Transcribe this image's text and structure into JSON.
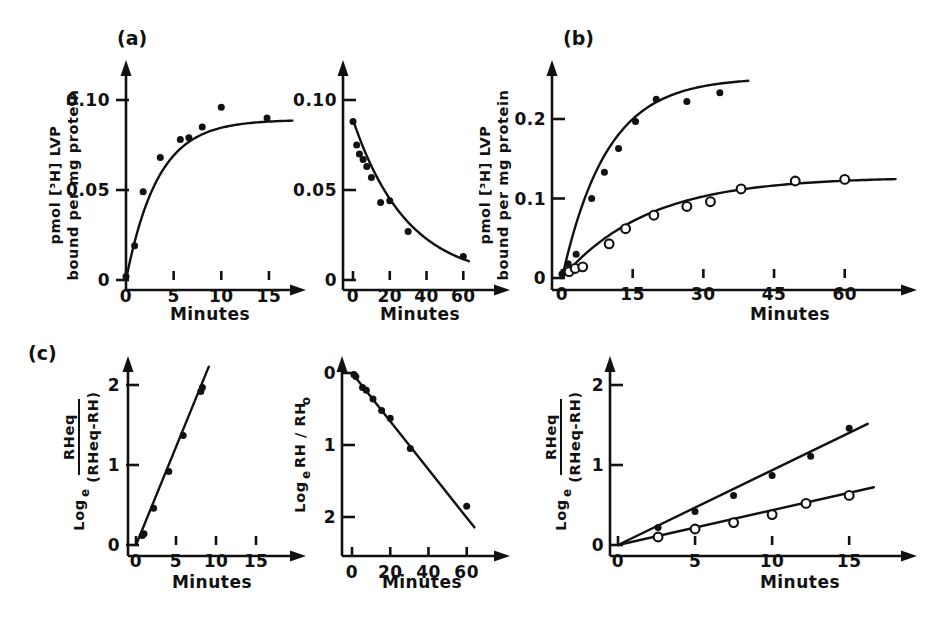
{
  "figure": {
    "background": "#ffffff",
    "ink_color": "#111111",
    "axis_title_x": "Minutes",
    "panel_labels": {
      "a": "(a)",
      "b": "(b)",
      "c": "(c)"
    }
  },
  "chart_data": [
    {
      "id": "panel-a-association",
      "type": "scatter",
      "panel_label": "(a)",
      "title": "",
      "xlabel": "Minutes",
      "ylabel": "pmol [3H] LVP bound per mg protein",
      "ylabel_line1": "pmol [³H] LVP",
      "ylabel_line2": "bound per mg protein",
      "xlim": [
        0,
        17
      ],
      "ylim": [
        0,
        0.112
      ],
      "xticks": [
        0,
        5,
        10,
        15
      ],
      "xtick_labels": [
        "0",
        "5",
        "10",
        "15"
      ],
      "yticks": [
        0,
        0.05,
        0.1
      ],
      "ytick_labels": [
        "0",
        "0.05",
        "0.10"
      ],
      "grid": false,
      "legend": "none",
      "series": [
        {
          "name": "association",
          "marker": "filled-circle",
          "x": [
            0.0,
            0.9,
            1.8,
            3.6,
            5.7,
            6.6,
            8.0,
            10.0,
            14.8
          ],
          "y": [
            0.002,
            0.019,
            0.049,
            0.068,
            0.078,
            0.079,
            0.085,
            0.096,
            0.09
          ],
          "fit": "exponential-rise",
          "fit_plateau": 0.089,
          "fit_rate": 0.3
        }
      ]
    },
    {
      "id": "panel-a-dissociation",
      "type": "scatter",
      "panel_label": "",
      "title": "",
      "xlabel": "Minutes",
      "ylabel": "pmol [3H] LVP bound per mg protein",
      "xlim": [
        0,
        68
      ],
      "ylim": [
        0,
        0.112
      ],
      "xticks": [
        0,
        20,
        40,
        60
      ],
      "xtick_labels": [
        "0",
        "20",
        "40",
        "60"
      ],
      "yticks": [
        0,
        0.05,
        0.1
      ],
      "ytick_labels": [
        "0",
        "0.05",
        "0.10"
      ],
      "grid": false,
      "legend": "none",
      "series": [
        {
          "name": "dissociation",
          "marker": "filled-circle",
          "x": [
            0.0,
            2.0,
            3.5,
            5.5,
            7.5,
            10.0,
            15.0,
            20.0,
            30.0,
            60.0
          ],
          "y": [
            0.088,
            0.075,
            0.07,
            0.067,
            0.063,
            0.057,
            0.043,
            0.044,
            0.027,
            0.013
          ],
          "fit": "exponential-decay",
          "fit_start": 0.089,
          "fit_rate": 0.034
        }
      ]
    },
    {
      "id": "panel-b",
      "type": "scatter",
      "panel_label": "(b)",
      "title": "",
      "xlabel": "Minutes",
      "ylabel": "pmol [3H] LVP bound per mg protein",
      "ylabel_line1": "pmol [³H] LVP",
      "ylabel_line2": "bound per mg protein",
      "xlim": [
        0,
        66
      ],
      "ylim": [
        0,
        0.275
      ],
      "xticks": [
        0,
        15,
        30,
        45,
        60
      ],
      "xtick_labels": [
        "0",
        "15",
        "30",
        "45",
        "60"
      ],
      "yticks": [
        0,
        0.1,
        0.2
      ],
      "ytick_labels": [
        "0",
        "0.1",
        "0.2"
      ],
      "grid": false,
      "legend": "none",
      "series": [
        {
          "name": "upper-filled",
          "marker": "filled-circle",
          "x": [
            0.0,
            1.3,
            3.0,
            6.3,
            9.0,
            12.0,
            15.6,
            20.0,
            26.5,
            33.5
          ],
          "y": [
            0.005,
            0.018,
            0.03,
            0.1,
            0.133,
            0.163,
            0.197,
            0.225,
            0.222,
            0.233
          ],
          "fit": "exponential-rise",
          "fit_plateau": 0.252,
          "fit_rate": 0.105
        },
        {
          "name": "lower-open",
          "marker": "open-circle",
          "x": [
            1.5,
            2.8,
            4.4,
            10.0,
            13.5,
            19.5,
            26.5,
            31.5,
            38.0,
            49.5,
            60.0
          ],
          "y": [
            0.008,
            0.012,
            0.014,
            0.043,
            0.062,
            0.079,
            0.09,
            0.096,
            0.112,
            0.122,
            0.124
          ],
          "fit": "exponential-rise",
          "fit_plateau": 0.127,
          "fit_rate": 0.055
        }
      ]
    },
    {
      "id": "panel-c-association",
      "type": "scatter",
      "panel_label": "(c)",
      "title": "",
      "xlabel": "Minutes",
      "ylabel": "Log e ( RHeq / (RHeq - RH) )",
      "ylabel_log": "Log",
      "ylabel_log_sub": "e",
      "ylabel_num": "RHeq",
      "ylabel_den": "(RHeq-RH)",
      "xlim": [
        0,
        17
      ],
      "ylim": [
        0,
        2.35
      ],
      "xticks": [
        0,
        5,
        10,
        15
      ],
      "xtick_labels": [
        "0",
        "5",
        "10",
        "15"
      ],
      "yticks": [
        0,
        1,
        2
      ],
      "ytick_labels": [
        "0",
        "1",
        "2"
      ],
      "grid": false,
      "legend": "none",
      "series": [
        {
          "name": "slope-line",
          "marker": "filled-circle",
          "x": [
            0.8,
            1.0,
            2.2,
            4.1,
            5.9,
            8.1,
            8.3
          ],
          "y": [
            0.12,
            0.14,
            0.46,
            0.92,
            1.37,
            1.92,
            1.97
          ],
          "fit": "linear",
          "fit_slope": 0.245,
          "fit_intercept": 0.0,
          "fit_x_range": [
            0.0,
            9.1
          ]
        }
      ]
    },
    {
      "id": "panel-c-dissociation",
      "type": "scatter",
      "panel_label": "",
      "title": "",
      "xlabel": "Minutes",
      "ylabel": "Log e RH / RH o",
      "ylabel_log": "Log",
      "ylabel_log_sub": "e",
      "ylabel_rest": "RH / RH",
      "ylabel_rest_sub": "o",
      "y_axis_inverted": true,
      "xlim": [
        0,
        68
      ],
      "ylim": [
        0,
        2.35
      ],
      "xticks": [
        0,
        20,
        40,
        60
      ],
      "xtick_labels": [
        "0",
        "20",
        "40",
        "60"
      ],
      "yticks": [
        0,
        1,
        2
      ],
      "ytick_labels": [
        "0",
        "1",
        "2"
      ],
      "grid": false,
      "legend": "none",
      "series": [
        {
          "name": "decay-line",
          "marker": "filled-circle",
          "x": [
            1.0,
            2.0,
            5.5,
            7.5,
            11.0,
            15.5,
            20.0,
            30.5,
            60.0
          ],
          "y": [
            0.02,
            0.05,
            0.2,
            0.24,
            0.36,
            0.52,
            0.63,
            1.05,
            1.85
          ],
          "fit": "linear",
          "fit_slope": 0.0335,
          "fit_intercept": 0.0,
          "fit_x_range": [
            0.0,
            64.0
          ]
        }
      ]
    },
    {
      "id": "panel-c-right",
      "type": "scatter",
      "panel_label": "",
      "title": "",
      "xlabel": "Minutes",
      "ylabel": "Log e ( RHeq / (RHeq - RH) )",
      "ylabel_log": "Log",
      "ylabel_log_sub": "e",
      "ylabel_num": "RHeq",
      "ylabel_den": "(RHeq-RH)",
      "xlim": [
        0,
        17
      ],
      "ylim": [
        0,
        2.35
      ],
      "xticks": [
        0,
        5,
        10,
        15
      ],
      "xtick_labels": [
        "0",
        "5",
        "10",
        "15"
      ],
      "yticks": [
        0,
        1,
        2
      ],
      "ytick_labels": [
        "0",
        "1",
        "2"
      ],
      "grid": false,
      "legend": "none",
      "series": [
        {
          "name": "upper-filled",
          "marker": "filled-circle",
          "x": [
            2.6,
            5.0,
            7.5,
            10.0,
            12.5,
            15.0
          ],
          "y": [
            0.22,
            0.42,
            0.62,
            0.87,
            1.11,
            1.46
          ],
          "fit": "linear",
          "fit_slope": 0.0935,
          "fit_intercept": 0.0,
          "fit_x_range": [
            0.0,
            16.2
          ]
        },
        {
          "name": "lower-open",
          "marker": "open-circle",
          "x": [
            2.6,
            5.0,
            7.5,
            10.0,
            12.2,
            15.0
          ],
          "y": [
            0.1,
            0.2,
            0.28,
            0.38,
            0.52,
            0.62
          ],
          "fit": "linear",
          "fit_slope": 0.0435,
          "fit_intercept": 0.0,
          "fit_x_range": [
            0.0,
            16.6
          ]
        }
      ]
    }
  ]
}
